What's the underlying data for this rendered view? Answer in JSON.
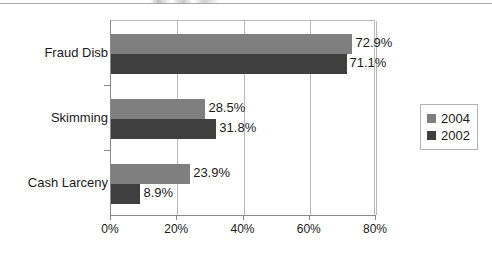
{
  "chart_data": {
    "type": "bar",
    "orientation": "horizontal",
    "title": "",
    "xlabel": "",
    "ylabel": "",
    "categories": [
      "Fraud Disb",
      "Skimming",
      "Cash Larceny"
    ],
    "series": [
      {
        "name": "2004",
        "color": "#7f7f7f",
        "values": [
          72.9,
          28.5,
          23.9
        ],
        "labels": [
          "72.9%",
          "28.5%",
          "23.9%"
        ]
      },
      {
        "name": "2002",
        "color": "#3f3f3f",
        "values": [
          71.1,
          31.8,
          8.9
        ],
        "labels": [
          "71.1%",
          "31.8%",
          "8.9%"
        ]
      }
    ],
    "xlim": [
      0,
      80
    ],
    "xticks": [
      0,
      20,
      40,
      60,
      80
    ],
    "xtick_labels": [
      "0%",
      "20%",
      "40%",
      "60%",
      "80%"
    ],
    "grid": true,
    "grid_axis": "x",
    "legend_position": "right"
  },
  "legend": {
    "entries": [
      {
        "label": "2004",
        "swatch": "light-gray-swatch"
      },
      {
        "label": "2002",
        "swatch": "dark-gray-swatch"
      }
    ]
  }
}
